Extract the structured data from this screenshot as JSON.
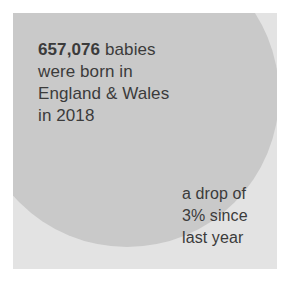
{
  "card": {
    "background_color": "#e3e3e3",
    "circle_color": "#c9c9c9",
    "text_color": "#3b3b3b",
    "page_background": "#ffffff"
  },
  "primary_statement": {
    "headline_figure": "657,076",
    "line1_rest": " babies",
    "line2": "were born in",
    "line3": "England & Wales",
    "line4": "in 2018"
  },
  "secondary_statement": {
    "line1": "a drop of",
    "line2": "3% since",
    "line3": "last year"
  },
  "facts": {
    "births_count": "657,076",
    "births_count_numeric": 657076,
    "region": "England & Wales",
    "year": "2018",
    "change_percent": "3%",
    "change_direction": "drop",
    "comparison_period": "last year"
  }
}
